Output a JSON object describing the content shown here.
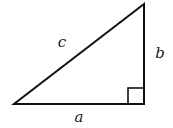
{
  "diagram": {
    "type": "right-triangle",
    "stroke_color": "#111111",
    "stroke_width": 2,
    "vertices": {
      "bottom_left": [
        14,
        104
      ],
      "right_angle": [
        144,
        104
      ],
      "top": [
        144,
        4
      ]
    },
    "right_angle_marker": {
      "x": 128,
      "y": 88,
      "size": 16
    },
    "labels": {
      "hypotenuse": "c",
      "vertical_leg": "b",
      "horizontal_leg": "a"
    },
    "label_positions": {
      "hypotenuse": [
        62,
        47
      ],
      "vertical_leg": [
        160,
        58
      ],
      "horizontal_leg": [
        79,
        122
      ]
    }
  }
}
